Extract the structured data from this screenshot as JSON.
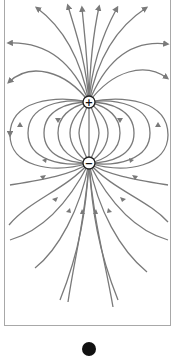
{
  "figure": {
    "type": "electric dipole field lines",
    "charges": [
      {
        "sign": "+",
        "label": "+",
        "x": 89,
        "y": 102
      },
      {
        "sign": "-",
        "label": "−",
        "x": 89,
        "y": 163
      }
    ],
    "line_color": "#7a7a7a",
    "frame_color": "#a8a8a8",
    "panel_label": "a"
  }
}
